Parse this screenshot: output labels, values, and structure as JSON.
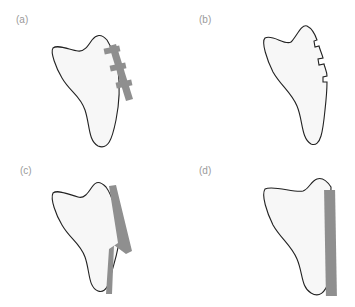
{
  "figure": {
    "panels": [
      {
        "id": "a",
        "label": "(a)",
        "description": "Bone outline with plate fixed by three screws/crossbars along right edge"
      },
      {
        "id": "b",
        "label": "(b)",
        "description": "Bone outline with three notches cut on right edge (plate removed)"
      },
      {
        "id": "c",
        "label": "(c)",
        "description": "Bone outline with bent (angled) plate along right edge"
      },
      {
        "id": "d",
        "label": "(d)",
        "description": "Bone outline with straight vertical plate along right edge"
      }
    ],
    "colors": {
      "outline": "#222222",
      "fill": "#f7f7f7",
      "plate": "#8f8f8f",
      "label": "#9a9a9a"
    }
  }
}
